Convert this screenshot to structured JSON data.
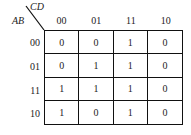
{
  "kmap": {
    "row_variable": "AB",
    "col_variable": "CD",
    "col_headers": [
      "00",
      "01",
      "11",
      "10"
    ],
    "row_headers": [
      "00",
      "01",
      "11",
      "10"
    ],
    "cells": [
      [
        "0",
        "0",
        "1",
        "0"
      ],
      [
        "0",
        "1",
        "1",
        "0"
      ],
      [
        "1",
        "1",
        "1",
        "0"
      ],
      [
        "1",
        "0",
        "1",
        "0"
      ]
    ]
  }
}
